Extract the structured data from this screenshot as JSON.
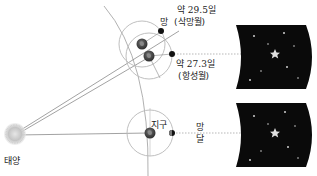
{
  "diagram": {
    "title": "",
    "labels": {
      "sun": "태양",
      "earth": "지구",
      "moon": "달",
      "full_moon_bottom": "망",
      "full_moon_top": "망",
      "synodic_period": "약 29.5일",
      "synodic_name": "(삭망월)",
      "sidereal_period": "약 27.3일",
      "sidereal_name": "(항성월)"
    },
    "colors": {
      "background": "#ffffff",
      "sky_panel": "#0a0a0a",
      "orbit_line": "#b0b0b0",
      "ray_line": "#8a8a8a",
      "dotted_line": "#9a9a9a",
      "star": "#dddddd",
      "sun": "#c8c8c8",
      "earth": "#444444",
      "moon": "#111111"
    },
    "panels": [
      {
        "name": "sky-panel-top"
      },
      {
        "name": "sky-panel-bottom"
      }
    ]
  }
}
